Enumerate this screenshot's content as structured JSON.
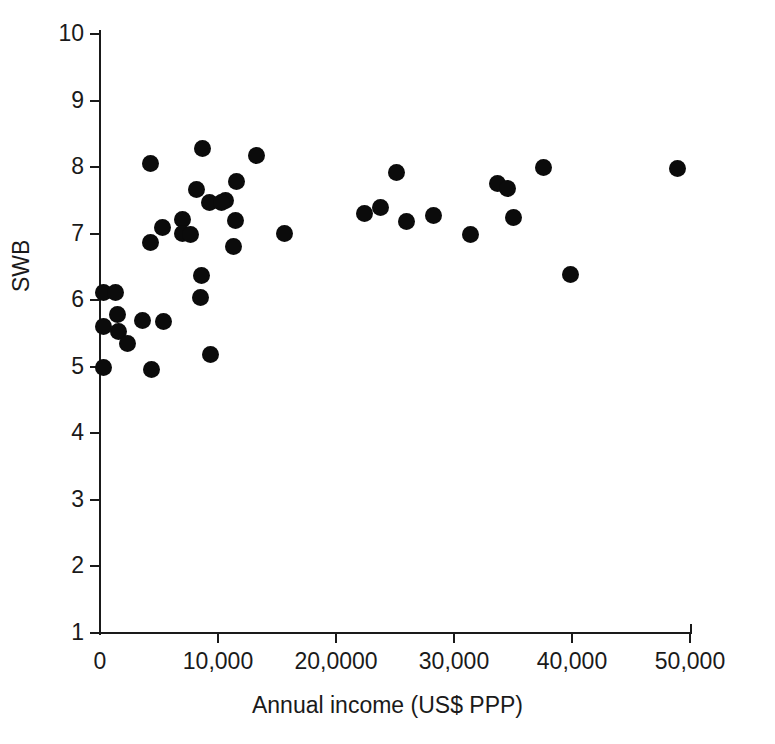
{
  "chart_data": {
    "type": "scatter",
    "title": "",
    "xlabel": "Annual income (US$ PPP)",
    "ylabel": "SWB",
    "xlim": [
      0,
      50000
    ],
    "ylim": [
      1,
      10
    ],
    "grid": false,
    "legend": "none",
    "marker": "filled-circle-black",
    "marker_color": "#0b0b0b",
    "xticks": [
      0,
      10000,
      20000,
      30000,
      40000,
      50000
    ],
    "xticklabels": [
      "0",
      "10,000",
      "20,0000",
      "30,000",
      "40,000",
      "50,000"
    ],
    "yticks": [
      1,
      2,
      3,
      4,
      5,
      6,
      7,
      8,
      9,
      10
    ],
    "yticklabels": [
      "1",
      "2",
      "3",
      "4",
      "5",
      "6",
      "7",
      "8",
      "9",
      "10"
    ],
    "n_points": 45,
    "points": [
      {
        "x": 300,
        "y": 6.12
      },
      {
        "x": 1300,
        "y": 6.11
      },
      {
        "x": 300,
        "y": 5.6
      },
      {
        "x": 1500,
        "y": 5.78
      },
      {
        "x": 1600,
        "y": 5.53
      },
      {
        "x": 2300,
        "y": 5.35
      },
      {
        "x": 300,
        "y": 4.99
      },
      {
        "x": 4400,
        "y": 4.96
      },
      {
        "x": 3600,
        "y": 5.7
      },
      {
        "x": 5400,
        "y": 5.68
      },
      {
        "x": 4300,
        "y": 8.05
      },
      {
        "x": 4300,
        "y": 6.87
      },
      {
        "x": 5300,
        "y": 7.1
      },
      {
        "x": 7000,
        "y": 7.22
      },
      {
        "x": 7000,
        "y": 7.0
      },
      {
        "x": 7700,
        "y": 6.98
      },
      {
        "x": 8700,
        "y": 8.28
      },
      {
        "x": 8200,
        "y": 7.67
      },
      {
        "x": 9300,
        "y": 7.47
      },
      {
        "x": 8600,
        "y": 6.37
      },
      {
        "x": 8500,
        "y": 6.04
      },
      {
        "x": 9400,
        "y": 5.18
      },
      {
        "x": 10600,
        "y": 7.5
      },
      {
        "x": 10300,
        "y": 7.47
      },
      {
        "x": 11600,
        "y": 7.78
      },
      {
        "x": 11500,
        "y": 7.2
      },
      {
        "x": 11300,
        "y": 6.8
      },
      {
        "x": 13300,
        "y": 8.18
      },
      {
        "x": 15600,
        "y": 7.0
      },
      {
        "x": 22400,
        "y": 7.3
      },
      {
        "x": 23800,
        "y": 7.4
      },
      {
        "x": 25100,
        "y": 7.92
      },
      {
        "x": 26000,
        "y": 7.18
      },
      {
        "x": 28300,
        "y": 7.28
      },
      {
        "x": 31400,
        "y": 6.98
      },
      {
        "x": 33700,
        "y": 7.75
      },
      {
        "x": 34500,
        "y": 7.68
      },
      {
        "x": 35000,
        "y": 7.25
      },
      {
        "x": 37600,
        "y": 8.0
      },
      {
        "x": 39900,
        "y": 6.38
      },
      {
        "x": 48900,
        "y": 7.98
      }
    ]
  }
}
